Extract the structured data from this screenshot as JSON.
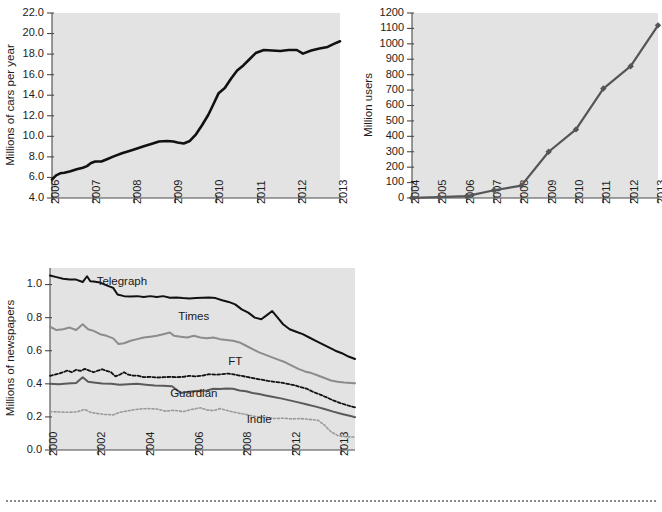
{
  "chart_data": [
    {
      "id": "cars",
      "type": "line",
      "title": "",
      "xlabel": "",
      "ylabel": "Millions of cars per year",
      "xlim": [
        2006,
        2013
      ],
      "ylim": [
        4.0,
        22.0
      ],
      "yticks": [
        "4.0",
        "6.0",
        "8.0",
        "10.0",
        "12.0",
        "14.0",
        "16.0",
        "18.0",
        "20.0",
        "22.0"
      ],
      "xticks": [
        "2006",
        "2007",
        "2008",
        "2009",
        "2010",
        "2011",
        "2012",
        "2013"
      ],
      "grid": false,
      "legend": "none",
      "series": [
        {
          "name": "cars",
          "color": "#111111",
          "width": 2.6,
          "dash": "none",
          "x": [
            2006.0,
            2006.1,
            2006.2,
            2006.3,
            2006.45,
            2006.6,
            2006.75,
            2006.85,
            2006.95,
            2007.05,
            2007.2,
            2007.35,
            2007.5,
            2007.7,
            2007.9,
            2008.05,
            2008.25,
            2008.45,
            2008.6,
            2008.8,
            2008.95,
            2009.05,
            2009.2,
            2009.35,
            2009.5,
            2009.65,
            2009.8,
            2009.92,
            2010.05,
            2010.2,
            2010.35,
            2010.5,
            2010.65,
            2010.8,
            2010.95,
            2011.15,
            2011.35,
            2011.55,
            2011.75,
            2011.95,
            2012.1,
            2012.3,
            2012.5,
            2012.7,
            2012.85,
            2013.0
          ],
          "y": [
            5.8,
            6.2,
            6.4,
            6.45,
            6.6,
            6.8,
            6.95,
            7.1,
            7.4,
            7.55,
            7.55,
            7.8,
            8.05,
            8.35,
            8.6,
            8.8,
            9.05,
            9.3,
            9.5,
            9.55,
            9.5,
            9.4,
            9.3,
            9.55,
            10.2,
            11.1,
            12.1,
            13.1,
            14.2,
            14.7,
            15.6,
            16.4,
            16.9,
            17.5,
            18.1,
            18.4,
            18.35,
            18.3,
            18.4,
            18.4,
            18.05,
            18.35,
            18.55,
            18.7,
            19.0,
            19.25
          ]
        }
      ]
    },
    {
      "id": "users",
      "type": "line",
      "title": "",
      "xlabel": "",
      "ylabel": "Million users",
      "xlim": [
        2004,
        2013
      ],
      "ylim": [
        0,
        1200
      ],
      "yticks": [
        "0",
        "100",
        "200",
        "300",
        "400",
        "500",
        "600",
        "700",
        "800",
        "900",
        "1000",
        "1100",
        "1200"
      ],
      "xticks": [
        "2004",
        "2005",
        "2006",
        "2007",
        "2008",
        "2009",
        "2010",
        "2011",
        "2012",
        "2013"
      ],
      "grid": false,
      "legend": "none",
      "markers": "diamond",
      "series": [
        {
          "name": "users",
          "color": "#555555",
          "width": 2.2,
          "dash": "none",
          "x": [
            2004,
            2005,
            2006,
            2007,
            2008,
            2009,
            2010,
            2011,
            2012,
            2013
          ],
          "y": [
            1,
            5.5,
            12,
            50,
            80,
            300,
            445,
            710,
            855,
            1120
          ]
        }
      ]
    },
    {
      "id": "newspapers",
      "type": "line",
      "title": "",
      "xlabel": "",
      "ylabel": "Millions of newspapers",
      "xlim": [
        2000,
        2014
      ],
      "ylim": [
        0.0,
        1.1
      ],
      "yticks": [
        "0.0",
        "0.2",
        "0.4",
        "0.6",
        "0.8",
        "1.0"
      ],
      "xticks": [
        "2000",
        "2002",
        "2004",
        "2006",
        "2008",
        "2012",
        "2013"
      ],
      "grid": false,
      "legend": "inline-labels",
      "annotations": [
        {
          "text": "Telegraph",
          "x": 2003.3,
          "y": 0.995
        },
        {
          "text": "Times",
          "x": 2006.6,
          "y": 0.785
        },
        {
          "text": "FT",
          "x": 2008.5,
          "y": 0.515
        },
        {
          "text": "Guardian",
          "x": 2006.6,
          "y": 0.318
        },
        {
          "text": "Indie",
          "x": 2009.6,
          "y": 0.165
        }
      ],
      "series": [
        {
          "name": "Telegraph",
          "color": "#111111",
          "width": 2.0,
          "dash": "none",
          "x": [
            2000.0,
            2000.3,
            2000.6,
            2000.9,
            2001.2,
            2001.5,
            2001.7,
            2001.85,
            2002.0,
            2002.3,
            2002.6,
            2002.9,
            2003.1,
            2003.4,
            2003.7,
            2004.0,
            2004.3,
            2004.6,
            2004.9,
            2005.2,
            2005.5,
            2005.8,
            2006.1,
            2006.4,
            2006.7,
            2007.0,
            2007.3,
            2007.6,
            2007.9,
            2008.2,
            2008.5,
            2008.8,
            2009.1,
            2009.4,
            2009.7,
            2010.0,
            2010.2,
            2010.45,
            2010.7,
            2011.0,
            2011.3,
            2011.6,
            2011.9,
            2012.2,
            2012.5,
            2012.8,
            2013.1,
            2013.4,
            2013.7,
            2014.0
          ],
          "y": [
            1.055,
            1.045,
            1.035,
            1.03,
            1.03,
            1.015,
            1.05,
            1.02,
            1.018,
            1.012,
            0.995,
            0.98,
            0.94,
            0.93,
            0.928,
            0.93,
            0.925,
            0.93,
            0.925,
            0.93,
            0.92,
            0.922,
            0.918,
            0.915,
            0.918,
            0.92,
            0.922,
            0.918,
            0.905,
            0.895,
            0.88,
            0.85,
            0.83,
            0.8,
            0.79,
            0.82,
            0.84,
            0.8,
            0.76,
            0.73,
            0.715,
            0.7,
            0.68,
            0.66,
            0.64,
            0.62,
            0.6,
            0.585,
            0.565,
            0.55
          ]
        },
        {
          "name": "Times",
          "color": "#8c8c8c",
          "width": 2.0,
          "dash": "none",
          "x": [
            2000.0,
            2000.3,
            2000.6,
            2000.9,
            2001.2,
            2001.5,
            2001.75,
            2002.0,
            2002.3,
            2002.6,
            2002.9,
            2003.15,
            2003.4,
            2003.7,
            2004.0,
            2004.3,
            2004.6,
            2004.9,
            2005.2,
            2005.5,
            2005.7,
            2006.0,
            2006.3,
            2006.6,
            2006.9,
            2007.2,
            2007.5,
            2007.8,
            2008.1,
            2008.4,
            2008.7,
            2009.0,
            2009.3,
            2009.6,
            2009.9,
            2010.2,
            2010.5,
            2010.8,
            2011.1,
            2011.4,
            2011.7,
            2012.0,
            2012.3,
            2012.6,
            2012.9,
            2013.2,
            2013.5,
            2013.8,
            2014.0
          ],
          "y": [
            0.745,
            0.725,
            0.73,
            0.74,
            0.725,
            0.76,
            0.73,
            0.72,
            0.7,
            0.69,
            0.675,
            0.64,
            0.645,
            0.66,
            0.67,
            0.68,
            0.685,
            0.69,
            0.7,
            0.71,
            0.69,
            0.685,
            0.68,
            0.69,
            0.68,
            0.675,
            0.68,
            0.67,
            0.665,
            0.66,
            0.65,
            0.63,
            0.61,
            0.59,
            0.575,
            0.56,
            0.545,
            0.53,
            0.51,
            0.49,
            0.475,
            0.465,
            0.45,
            0.435,
            0.42,
            0.412,
            0.408,
            0.405,
            0.403
          ]
        },
        {
          "name": "FT",
          "color": "#111111",
          "width": 1.8,
          "dash": "3,2",
          "x": [
            2000.0,
            2000.2,
            2000.4,
            2000.6,
            2000.8,
            2001.0,
            2001.2,
            2001.4,
            2001.6,
            2001.8,
            2002.0,
            2002.2,
            2002.4,
            2002.6,
            2002.8,
            2003.0,
            2003.2,
            2003.4,
            2003.6,
            2003.8,
            2004.0,
            2004.3,
            2004.6,
            2004.9,
            2005.2,
            2005.5,
            2005.8,
            2006.1,
            2006.4,
            2006.7,
            2007.0,
            2007.3,
            2007.6,
            2007.9,
            2008.2,
            2008.5,
            2008.8,
            2009.1,
            2009.4,
            2009.7,
            2010.0,
            2010.3,
            2010.6,
            2010.9,
            2011.2,
            2011.5,
            2011.8,
            2012.1,
            2012.4,
            2012.7,
            2013.0,
            2013.3,
            2013.6,
            2014.0
          ],
          "y": [
            0.448,
            0.455,
            0.462,
            0.47,
            0.48,
            0.47,
            0.485,
            0.478,
            0.49,
            0.48,
            0.47,
            0.48,
            0.488,
            0.478,
            0.47,
            0.445,
            0.455,
            0.47,
            0.455,
            0.45,
            0.45,
            0.44,
            0.442,
            0.438,
            0.44,
            0.442,
            0.44,
            0.442,
            0.448,
            0.445,
            0.45,
            0.458,
            0.455,
            0.458,
            0.462,
            0.455,
            0.448,
            0.44,
            0.432,
            0.425,
            0.418,
            0.412,
            0.408,
            0.4,
            0.392,
            0.38,
            0.37,
            0.35,
            0.335,
            0.318,
            0.3,
            0.285,
            0.272,
            0.258
          ]
        },
        {
          "name": "Guardian",
          "color": "#5a5a5a",
          "width": 2.0,
          "dash": "none",
          "x": [
            2000.0,
            2000.4,
            2000.8,
            2001.2,
            2001.5,
            2001.75,
            2002.0,
            2002.4,
            2002.8,
            2003.2,
            2003.6,
            2004.0,
            2004.4,
            2004.8,
            2005.2,
            2005.6,
            2006.0,
            2006.3,
            2006.6,
            2006.9,
            2007.2,
            2007.5,
            2007.8,
            2008.1,
            2008.4,
            2008.7,
            2009.0,
            2009.3,
            2009.6,
            2009.9,
            2010.2,
            2010.6,
            2011.0,
            2011.4,
            2011.8,
            2012.2,
            2012.6,
            2013.0,
            2013.4,
            2013.8,
            2014.0
          ],
          "y": [
            0.4,
            0.398,
            0.402,
            0.405,
            0.44,
            0.412,
            0.408,
            0.402,
            0.4,
            0.395,
            0.398,
            0.4,
            0.395,
            0.39,
            0.388,
            0.385,
            0.345,
            0.35,
            0.355,
            0.358,
            0.36,
            0.37,
            0.368,
            0.372,
            0.37,
            0.36,
            0.355,
            0.345,
            0.338,
            0.33,
            0.322,
            0.312,
            0.3,
            0.288,
            0.275,
            0.262,
            0.248,
            0.232,
            0.218,
            0.205,
            0.198
          ]
        },
        {
          "name": "Indie",
          "color": "#9a9a9a",
          "width": 1.6,
          "dash": "2,2",
          "x": [
            2000.0,
            2000.4,
            2000.8,
            2001.2,
            2001.6,
            2001.85,
            2002.1,
            2002.5,
            2002.9,
            2003.2,
            2003.5,
            2003.8,
            2004.1,
            2004.5,
            2004.9,
            2005.3,
            2005.7,
            2006.1,
            2006.5,
            2006.9,
            2007.2,
            2007.5,
            2007.8,
            2008.1,
            2008.4,
            2008.7,
            2009.0,
            2009.3,
            2009.6,
            2009.9,
            2010.3,
            2010.7,
            2011.1,
            2011.5,
            2011.9,
            2012.3,
            2012.6,
            2012.9,
            2013.2,
            2013.6,
            2014.0
          ],
          "y": [
            0.232,
            0.23,
            0.228,
            0.23,
            0.245,
            0.228,
            0.222,
            0.215,
            0.212,
            0.228,
            0.235,
            0.242,
            0.248,
            0.25,
            0.248,
            0.235,
            0.24,
            0.232,
            0.245,
            0.255,
            0.242,
            0.238,
            0.25,
            0.24,
            0.23,
            0.222,
            0.215,
            0.205,
            0.2,
            0.198,
            0.19,
            0.192,
            0.188,
            0.19,
            0.185,
            0.18,
            0.15,
            0.11,
            0.088,
            0.08,
            0.078
          ]
        }
      ]
    }
  ],
  "footer": {
    "rule": "dotted-separator"
  }
}
